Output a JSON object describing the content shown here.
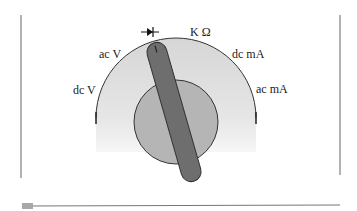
{
  "diagram": {
    "labels": {
      "dc_v": "dc V",
      "ac_v": "ac V",
      "kohm": "K Ω",
      "dc_ma": "dc mA",
      "ac_ma": "ac mA"
    },
    "icons": {
      "diode": "diode-symbol"
    },
    "colors": {
      "outer_dial": "#d9d9d9",
      "inner_knob": "#b3b3b3",
      "pointer": "#6b6b6b",
      "outline": "#333333",
      "frame": "#555555",
      "marker": "#a8a8a8"
    }
  }
}
